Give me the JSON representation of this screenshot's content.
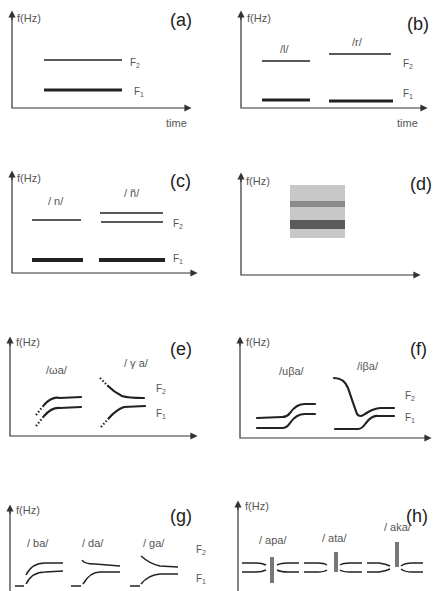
{
  "figure": {
    "axis_label_y": "f(Hz)",
    "axis_label_x": "time",
    "formant_labels": {
      "f1": "F1",
      "f2": "F2"
    },
    "panels": [
      {
        "id": "a",
        "label": "(a)",
        "segments": [],
        "show_time": true
      },
      {
        "id": "b",
        "label": "(b)",
        "segments": [
          "/l/",
          "/r/"
        ],
        "show_time": true
      },
      {
        "id": "c",
        "label": "(c)",
        "segments": [
          "/ n/",
          "/ ñ/"
        ]
      },
      {
        "id": "d",
        "label": "(d)",
        "segments": []
      },
      {
        "id": "e",
        "label": "(e)",
        "segments": [
          "/ωa/",
          "/ γ a/"
        ]
      },
      {
        "id": "f",
        "label": "(f)",
        "segments": [
          "/uβa/",
          "/iβa/"
        ]
      },
      {
        "id": "g",
        "label": "(g)",
        "segments": [
          "/ ba/",
          "/ da/",
          "/ ga/"
        ]
      },
      {
        "id": "h",
        "label": "(h)",
        "segments": [
          "/ apa/",
          "/ ata/",
          "/ aka/"
        ]
      }
    ]
  },
  "colors": {
    "line": "#222222",
    "axis": "#333333",
    "band_bg": "#c8c8c8",
    "band_f2": "#8a8a8a",
    "band_f1": "#5a5a5a",
    "burst": "#777777"
  }
}
